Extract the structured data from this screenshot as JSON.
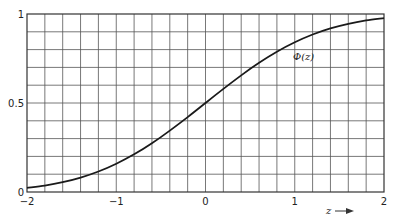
{
  "chart_data": {
    "type": "line",
    "title": "",
    "xlabel": "z",
    "ylabel": "",
    "curve_label": "Φ(z)",
    "xlim": [
      -2,
      2
    ],
    "ylim": [
      0,
      1
    ],
    "grid": true,
    "grid_x_step": 0.2,
    "grid_y_step": 0.1,
    "x_ticks": [
      -2,
      -1,
      0,
      1,
      2
    ],
    "x_tick_labels": [
      "−2",
      "−1",
      "0",
      "1",
      "2"
    ],
    "y_ticks": [
      0,
      0.5,
      1
    ],
    "y_tick_labels": [
      "0",
      "0.5",
      "1"
    ],
    "series": [
      {
        "name": "Φ(z)",
        "x": [
          -2,
          -1.8,
          -1.6,
          -1.4,
          -1.2,
          -1,
          -0.8,
          -0.6,
          -0.4,
          -0.2,
          0,
          0.2,
          0.4,
          0.6,
          0.8,
          1,
          1.2,
          1.4,
          1.6,
          1.8,
          2
        ],
        "values": [
          0.023,
          0.036,
          0.055,
          0.081,
          0.115,
          0.159,
          0.212,
          0.274,
          0.345,
          0.421,
          0.5,
          0.579,
          0.655,
          0.726,
          0.788,
          0.841,
          0.885,
          0.919,
          0.945,
          0.964,
          0.977
        ]
      }
    ],
    "legend": "none",
    "annotations": [
      "Φ(z)",
      "z →"
    ]
  }
}
